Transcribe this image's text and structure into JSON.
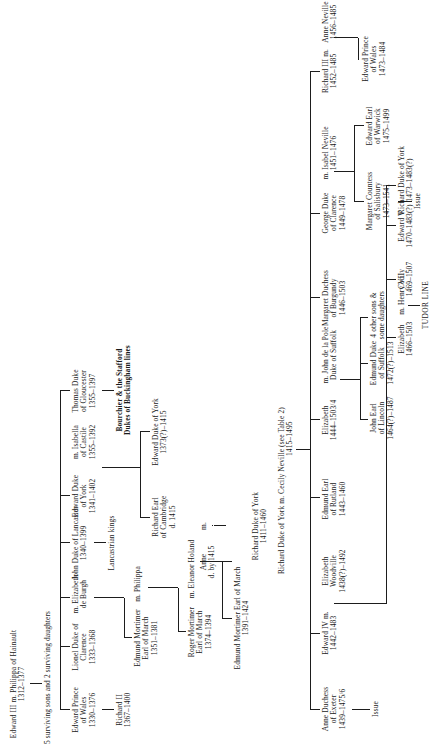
{
  "chart": {
    "root": {
      "name": "Edward III m. Philippa of Hainault",
      "dates": "1312–1377"
    },
    "note_children": "5 surviving sons and 2 surviving daughters",
    "tudor_line_label": "TUDOR LINE",
    "nodes": {
      "edward_prince_wales": {
        "l1": "Edward Prince",
        "l2": "of Wales",
        "l3": "1330–1376"
      },
      "richard_ii": {
        "l1": "Richard II",
        "l2": "1367–1400"
      },
      "lionel_clarence": {
        "l1": "Lionel Duke of",
        "l2": "Clarence",
        "l3": "1333–1368"
      },
      "elizabeth_de_burgh": {
        "l1": "m. Elizabeth",
        "l2": "de Burgh"
      },
      "john_lancaster": {
        "l1": "John Duke of Lancaster",
        "l2": "1340–1399"
      },
      "lancastrian_kings": {
        "l1": "Lancastrian kings"
      },
      "edmund_mortimer_march": {
        "l1": "Edmund Mortimer",
        "l2": "Earl of March",
        "l3": "1351–1381"
      },
      "philippa": {
        "l1": "m. Philippa"
      },
      "roger_mortimer_march": {
        "l1": "Roger Mortimer",
        "l2": "Earl of March",
        "l3": "1374–1394"
      },
      "eleanor_holand": {
        "l1": "m. Eleanor Holand"
      },
      "edmund_mortimer_march2": {
        "l1": "Edmund Mortimer Earl of March",
        "l2": "1391–1424"
      },
      "anne_mortimer": {
        "l1": "Anne",
        "l2": "d. by 1415"
      },
      "marriage_m": {
        "l1": "m."
      },
      "edward_duke_york": {
        "l1": "Edward Duke",
        "l2": "of York",
        "l3": "1341–1402"
      },
      "isabella_castile": {
        "l1": "m. Isabella",
        "l2": "of Castile",
        "l3": "1355–1392"
      },
      "thomas_gloucester": {
        "l1": "Thomas Duke",
        "l2": "of Gloucester",
        "l3": "1355–1397"
      },
      "bourchier_stafford": {
        "l1": "Bourchier & the Stafford",
        "l2": "Dukes of Buckingham lines"
      },
      "richard_cambridge": {
        "l1": "Richard Earl",
        "l2": "of Cambridge",
        "l3": "d. 1415"
      },
      "edward_duke_york2": {
        "l1": "Edward Duke of York",
        "l2": "1373(?)–1415"
      },
      "richard_duke_york": {
        "l1": "Richard Duke of York",
        "l2": "1411–1460"
      },
      "cecily_neville": {
        "l1": "Richard Duke of York m. Cecily Neville (see Table 2)",
        "l2": "1415–1495"
      },
      "anne_duchess_exeter": {
        "l1": "Anne Duchess",
        "l2": "of Exeter",
        "l3": "1439–1475/6"
      },
      "issue_exeter": {
        "l1": "Issue"
      },
      "edward_iv": {
        "l1": "Edward IV m.",
        "l2": "1442–1483"
      },
      "elizabeth_woodville": {
        "l1": "Elizabeth",
        "l2": "Woodville",
        "l3": "1438(?)–1492"
      },
      "edmund_rutland": {
        "l1": "Edmund Earl",
        "l2": "of Rutland",
        "l3": "1443–1460"
      },
      "elizabeth_york": {
        "l1": "Elizabeth",
        "l2": "1444–1503/4"
      },
      "john_de_la_pole_suffolk": {
        "l1": "m. John de la Pole",
        "l2": "Duke of Suffolk"
      },
      "john_earl_lincoln": {
        "l1": "John Earl",
        "l2": "of Lincoln",
        "l3": "1464(?)–1487"
      },
      "edmund_duke_suffolk": {
        "l1": "Edmund Duke",
        "l2": "of Suffolk",
        "l3": "1472(?)–1513"
      },
      "other_children_suffolk": {
        "l1": "4 other sons &",
        "l2": "some daughters"
      },
      "margaret_burgundy": {
        "l1": "Margaret Duchess",
        "l2": "of Burgundy",
        "l3": "1446–1503"
      },
      "george_clarence": {
        "l1": "George Duke",
        "l2": "of Clarence",
        "l3": "1449–1478"
      },
      "isabel_neville": {
        "l1": "m. Isabel Neville",
        "l2": "1451–1476"
      },
      "margaret_salisbury": {
        "l1": "Margaret Countess",
        "l2": "of  Salisbury",
        "l3": "1473–1541"
      },
      "issue_salisbury": {
        "l1": "Issue"
      },
      "edward_warwick": {
        "l1": "Edward Earl",
        "l2": "of Warwick",
        "l3": "1475–1499"
      },
      "richard_iii": {
        "l1": "Richard III m.",
        "l2": "1452–1485"
      },
      "anne_neville": {
        "l1": "Anne Neville",
        "l2": "1456–1485"
      },
      "edward_prince_wales2": {
        "l1": "Edward Prince",
        "l2": "of Wales",
        "l3": "1473–1484"
      },
      "elizabeth_of_york": {
        "l1": "Elizabeth",
        "l2": "1466–1503"
      },
      "henry_vii": {
        "l1": "m. Henry VII"
      },
      "cecily": {
        "l1": "Cecily",
        "l2": "1469–1507"
      },
      "edward_v": {
        "l1": "Edward V",
        "l2": "1470–1483(?)"
      },
      "richard_duke_york3": {
        "l1": "Richard Duke of York",
        "l2": "1473–1483(?)"
      }
    }
  }
}
